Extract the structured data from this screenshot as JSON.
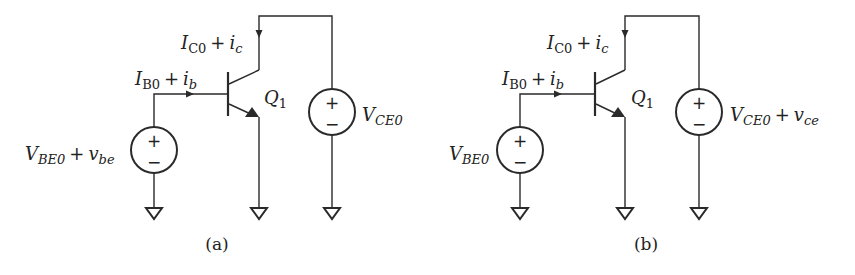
{
  "figure": {
    "panels": [
      {
        "id": "a",
        "caption": "(a)",
        "transistor": {
          "name": "Q",
          "sub": "1"
        },
        "base_current": {
          "main": "I",
          "sub": "B0",
          "plus": "+",
          "small": "i",
          "small_sub": "b"
        },
        "collector_current": {
          "main": "I",
          "sub": "C0",
          "plus": "+",
          "small": "i",
          "small_sub": "c"
        },
        "base_source": {
          "main": "V",
          "sub": "BE0",
          "plus": "+",
          "small": "v",
          "small_sub": "be",
          "pos": "+",
          "neg": "−"
        },
        "ce_source": {
          "main": "V",
          "sub": "CE0",
          "plus": "",
          "small": "",
          "small_sub": "",
          "pos": "+",
          "neg": "−"
        }
      },
      {
        "id": "b",
        "caption": "(b)",
        "transistor": {
          "name": "Q",
          "sub": "1"
        },
        "base_current": {
          "main": "I",
          "sub": "B0",
          "plus": "+",
          "small": "i",
          "small_sub": "b"
        },
        "collector_current": {
          "main": "I",
          "sub": "C0",
          "plus": "+",
          "small": "i",
          "small_sub": "c"
        },
        "base_source": {
          "main": "V",
          "sub": "BE0",
          "plus": "",
          "small": "",
          "small_sub": "",
          "pos": "+",
          "neg": "−"
        },
        "ce_source": {
          "main": "V",
          "sub": "CE0",
          "plus": "+",
          "small": "v",
          "small_sub": "ce",
          "pos": "+",
          "neg": "−"
        }
      }
    ],
    "colors": {
      "ink": "#2a2a2a",
      "background": "#ffffff"
    }
  }
}
